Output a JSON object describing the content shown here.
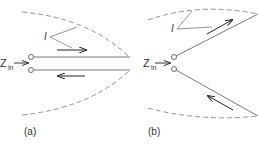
{
  "panels": [
    {
      "id": "a",
      "caption": "(a)",
      "current_label": "I",
      "impedance_label": "Z",
      "impedance_subscript": "in"
    },
    {
      "id": "b",
      "caption": "(b)",
      "current_label": "I",
      "impedance_label": "Z",
      "impedance_subscript": "in"
    }
  ],
  "colors": {
    "line": "#555555",
    "dash": "#777777",
    "arrow": "#222222",
    "text": "#333333"
  }
}
